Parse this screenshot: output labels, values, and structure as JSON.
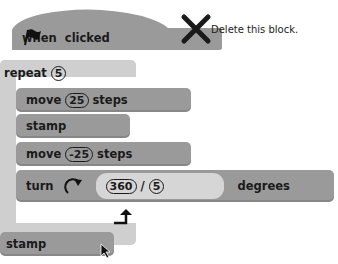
{
  "hat_block": {
    "when_label": "when",
    "flag_icon": "green-flag-icon",
    "clicked_label": "clicked"
  },
  "delete_hint": {
    "icon": "x-delete-icon",
    "text": "Delete this block."
  },
  "repeat_block": {
    "label": "repeat",
    "count": "5"
  },
  "inner_blocks": [
    {
      "pre": "move",
      "value": "25",
      "post": "steps"
    },
    {
      "pre": "stamp"
    },
    {
      "pre": "move",
      "value": "-25",
      "post": "steps"
    },
    {
      "pre": "turn",
      "icon": "rotate-clockwise-icon",
      "value_a": "360",
      "operator": "/",
      "value_b": "5",
      "post": "degrees"
    }
  ],
  "loop_end_icon": "loop-arrow-icon",
  "bottom_block": {
    "label": "stamp"
  },
  "cursor_icon": "mouse-pointer-icon",
  "colors": {
    "block": "#9a9a9a",
    "c_block": "#cfcfcf",
    "expression": "#d6d6d6",
    "text": "#1a1a1a"
  }
}
